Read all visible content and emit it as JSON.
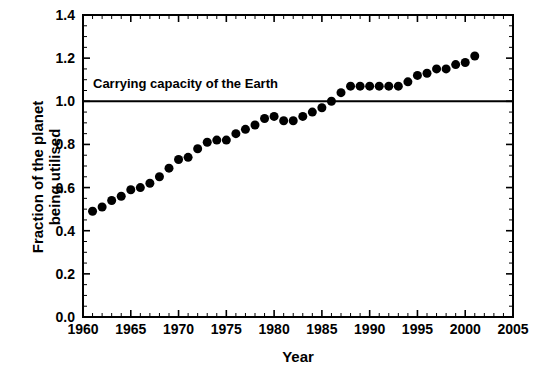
{
  "chart_data": {
    "type": "scatter",
    "title": "",
    "xlabel": "Year",
    "ylabel": "Fraction of the planet\nbeing utilised",
    "xlim": [
      1960,
      2005
    ],
    "ylim": [
      0.0,
      1.4
    ],
    "xticks": [
      1960,
      1965,
      1970,
      1975,
      1980,
      1985,
      1990,
      1995,
      2000,
      2005
    ],
    "xtick_labels": [
      "1960",
      "1965",
      "1970",
      "1975",
      "1980",
      "1985",
      "1990",
      "1995",
      "2000",
      "2005"
    ],
    "yticks": [
      0.0,
      0.2,
      0.4,
      0.6,
      0.8,
      1.0,
      1.2,
      1.4
    ],
    "ytick_labels": [
      "0.0",
      "0.2",
      "0.4",
      "0.6",
      "0.8",
      "1.0",
      "1.2",
      "1.4"
    ],
    "x_minor_tick_interval": 1,
    "y_minor_tick_interval": 0.05,
    "grid": false,
    "legend": false,
    "marker": "filled-circle",
    "marker_color": "#000000",
    "marker_size_px": 9,
    "x": [
      1961,
      1962,
      1963,
      1964,
      1965,
      1966,
      1967,
      1968,
      1969,
      1970,
      1971,
      1972,
      1973,
      1974,
      1975,
      1976,
      1977,
      1978,
      1979,
      1980,
      1981,
      1982,
      1983,
      1984,
      1985,
      1986,
      1987,
      1988,
      1989,
      1990,
      1991,
      1992,
      1993,
      1994,
      1995,
      1996,
      1997,
      1998,
      1999,
      2000,
      2001
    ],
    "values": [
      0.49,
      0.51,
      0.54,
      0.56,
      0.59,
      0.6,
      0.62,
      0.65,
      0.69,
      0.73,
      0.74,
      0.78,
      0.81,
      0.82,
      0.82,
      0.85,
      0.87,
      0.89,
      0.92,
      0.93,
      0.91,
      0.91,
      0.93,
      0.95,
      0.97,
      1.0,
      1.04,
      1.07,
      1.07,
      1.07,
      1.07,
      1.07,
      1.07,
      1.09,
      1.12,
      1.13,
      1.15,
      1.15,
      1.17,
      1.18,
      1.21
    ],
    "annotations": [
      {
        "text": "Carrying capacity of the Earth",
        "x": 1961,
        "y": 1.045
      }
    ],
    "reference_lines": [
      {
        "name": "carrying-capacity",
        "orientation": "horizontal",
        "y": 1.0,
        "color": "#000000",
        "width_px": 2
      }
    ],
    "axis_color": "#000000",
    "background_color": "#ffffff"
  }
}
